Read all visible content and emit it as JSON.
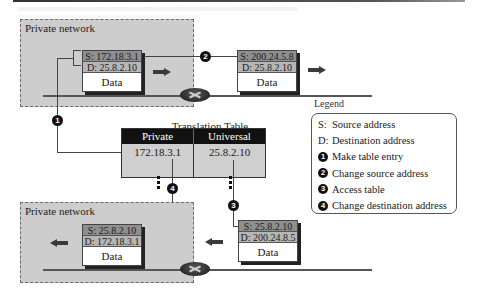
{
  "diagram": {
    "top_network": {
      "label": "Private network",
      "packet": {
        "src": "S: 172.18.3.1",
        "dst": "D: 25.8.2.10",
        "data": "Data"
      }
    },
    "outgoing_packet": {
      "src": "S: 200.24.5.8",
      "dst": "D: 25.8.2.10",
      "data": "Data"
    },
    "bottom_network": {
      "label": "Private network",
      "packet": {
        "src": "S: 25.8.2.10",
        "dst": "D: 172.18.3.1",
        "data": "Data"
      }
    },
    "incoming_packet": {
      "src": "S: 25.8.2.10",
      "dst": "D: 200.24.8.5",
      "data": "Data"
    },
    "translation_table": {
      "title": "Translation Table",
      "columns": [
        "Private",
        "Universal"
      ],
      "rows": [
        [
          "172.18.3.1",
          "25.8.2.10"
        ]
      ]
    },
    "step_markers": [
      "1",
      "2",
      "3",
      "4"
    ],
    "legend": {
      "title": "Legend",
      "items": [
        {
          "key": "S:",
          "text": "Source address"
        },
        {
          "key": "D:",
          "text": "Destination address"
        },
        {
          "key": "1",
          "text": "Make table entry"
        },
        {
          "key": "2",
          "text": "Change source address"
        },
        {
          "key": "3",
          "text": "Access table"
        },
        {
          "key": "4",
          "text": "Change destination address"
        }
      ]
    },
    "icons": {
      "router": "router-icon",
      "direction_right": "arrow-right-icon",
      "direction_left": "arrow-left-icon"
    },
    "colors": {
      "network_fill": "#cdcdcd",
      "header_fill": "#111111",
      "src_row": "#8f8f8f",
      "dst_row": "#b6b6b6"
    }
  }
}
